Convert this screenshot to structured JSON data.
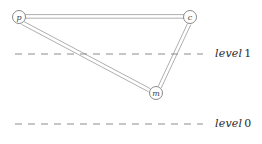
{
  "figure": {
    "width": 262,
    "height": 144,
    "background": "#ffffff",
    "edge_color": "#9a9a9a",
    "node_stroke": "#8a8a8a",
    "node_fill": "#ffffff",
    "dash_color": "#8c8c8c",
    "text_color": "#2a2a2a"
  },
  "nodes": [
    {
      "id": "p",
      "label": "p",
      "x": 19,
      "y": 17,
      "r": 6.5
    },
    {
      "id": "c",
      "label": "c",
      "x": 190,
      "y": 17,
      "r": 6.5
    },
    {
      "id": "m",
      "label": "m",
      "x": 156,
      "y": 93,
      "r": 6.5
    }
  ],
  "edges": [
    {
      "id": "edge-p-c",
      "from": "p",
      "to": "c"
    },
    {
      "id": "edge-p-m",
      "from": "p",
      "to": "m"
    },
    {
      "id": "edge-m-c",
      "from": "m",
      "to": "c"
    }
  ],
  "levels": [
    {
      "id": "level-1",
      "label_word": "level",
      "label_number": "1",
      "y": 54,
      "x_start": 15,
      "x_end": 203,
      "label_x": 215
    },
    {
      "id": "level-0",
      "label_word": "level",
      "label_number": "0",
      "y": 124,
      "x_start": 15,
      "x_end": 203,
      "label_x": 215
    }
  ]
}
